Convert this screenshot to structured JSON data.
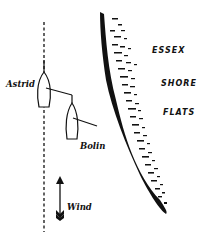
{
  "diagram": {
    "boats": [
      {
        "name": "Astrid"
      },
      {
        "name": "Bolin"
      }
    ],
    "shore_labels": [
      "ESSEX",
      "SHORE",
      "FLATS"
    ],
    "wind_label": "Wind",
    "colors": {
      "ink": "#111111",
      "background": "#ffffff"
    }
  }
}
